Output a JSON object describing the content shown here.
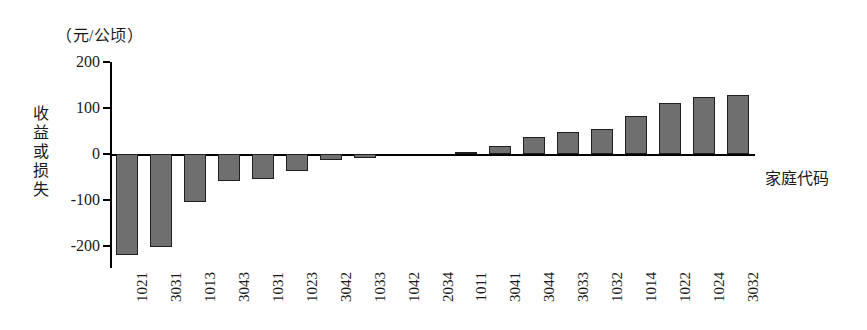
{
  "chart_data": {
    "type": "bar",
    "title": "",
    "subtitle": "",
    "unit_caption": "（元/公顷）",
    "ylabel": "收益或损失",
    "xlabel": "家庭代码",
    "categories": [
      "1021",
      "3031",
      "1013",
      "3043",
      "1031",
      "1023",
      "3042",
      "1033",
      "1042",
      "2034",
      "1011",
      "3041",
      "3044",
      "3033",
      "1032",
      "1014",
      "1022",
      "1024",
      "3032"
    ],
    "values": [
      -220,
      -202,
      -105,
      -58,
      -55,
      -38,
      -14,
      -9,
      0,
      0,
      5,
      17,
      38,
      48,
      55,
      82,
      110,
      125,
      128
    ],
    "ylim": [
      -240,
      210
    ],
    "yticks": [
      200,
      100,
      0,
      -100,
      -200
    ],
    "ytick_labels": [
      "200",
      "100",
      "0",
      "-100",
      "-200"
    ],
    "grid": false,
    "legend": null,
    "bar_color": "#6f6f6f",
    "bar_border_color": "#1f1f1f",
    "axis_color": "#000000"
  }
}
